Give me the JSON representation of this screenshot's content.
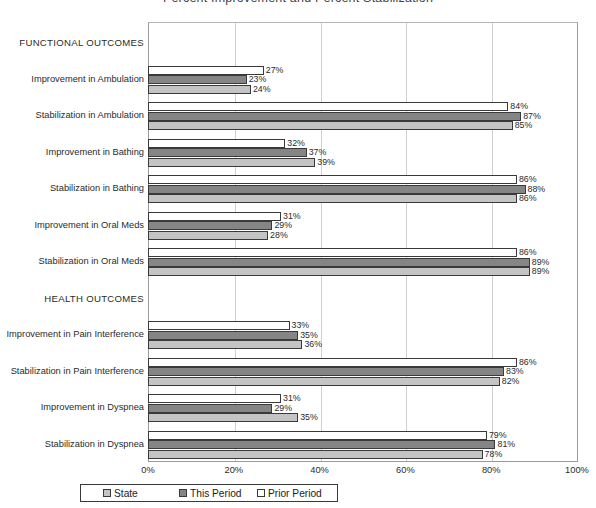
{
  "chart_data": {
    "type": "bar",
    "orientation": "horizontal",
    "title": "Percent Improvement and Percent Stabilization",
    "xlabel": "",
    "ylabel": "",
    "xlim": [
      0,
      100
    ],
    "xticks": [
      "0%",
      "20%",
      "40%",
      "60%",
      "80%",
      "100%"
    ],
    "xtick_values": [
      0,
      20,
      40,
      60,
      80,
      100
    ],
    "grid": true,
    "value_suffix": "%",
    "legend_position": "bottom",
    "series": [
      {
        "name": "State",
        "color": "#c4c4c4",
        "values": [
          24,
          85,
          39,
          86,
          28,
          89,
          36,
          82,
          35,
          78
        ]
      },
      {
        "name": "This Period",
        "color": "#858585",
        "values": [
          23,
          87,
          37,
          88,
          29,
          89,
          35,
          83,
          29,
          81
        ]
      },
      {
        "name": "Prior Period",
        "color": "#ffffff",
        "values": [
          27,
          84,
          32,
          86,
          31,
          86,
          33,
          86,
          31,
          79
        ]
      }
    ],
    "categories": [
      "Improvement in Ambulation",
      "Stabilization in Ambulation",
      "Improvement in Bathing",
      "Stabilization in Bathing",
      "Improvement in Oral Meds",
      "Stabilization in Oral Meds",
      "Improvement in Pain Interference",
      "Stabilization in Pain Interference",
      "Improvement in Dyspnea",
      "Stabilization in Dyspnea"
    ],
    "sections": [
      {
        "label": "FUNCTIONAL OUTCOMES",
        "categories": [
          0,
          1,
          2,
          3,
          4,
          5
        ]
      },
      {
        "label": "HEALTH OUTCOMES",
        "categories": [
          6,
          7,
          8,
          9
        ]
      }
    ]
  },
  "legend": {
    "items": [
      {
        "label": "State",
        "swatch": "sw-state"
      },
      {
        "label": "This Period",
        "swatch": "sw-period"
      },
      {
        "label": "Prior Period",
        "swatch": "sw-prior"
      }
    ]
  }
}
